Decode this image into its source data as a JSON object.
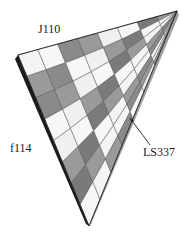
{
  "figure": {
    "type": "3d-surface-patch",
    "labels": {
      "top": "J110",
      "left": "f114",
      "right": "LS337"
    },
    "arrow": {
      "from": [
        150,
        145
      ],
      "to": [
        130,
        118
      ],
      "points_to": "right-edge"
    },
    "geometry": {
      "left_corner": [
        18,
        55
      ],
      "apex": [
        177,
        11
      ],
      "bottom": [
        89,
        226
      ],
      "grid_divisions_u": 8,
      "grid_divisions_v": 8
    },
    "colors": {
      "background": "#ffffff",
      "edge": "#111111",
      "grid_line": "#555555",
      "light_band": "#f2f2f2",
      "dark_band": "#6e6e6e",
      "side_wall": "#1a1a1a"
    }
  }
}
